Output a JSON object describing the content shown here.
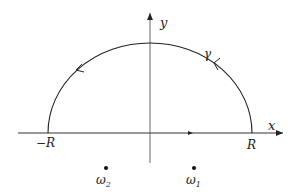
{
  "diagram": {
    "type": "contour-integral",
    "axes": {
      "x_label": "x",
      "y_label": "y"
    },
    "contour": {
      "label": "γ",
      "orientation": "counterclockwise",
      "radius_label": "R"
    },
    "endpoints": {
      "left": "−R",
      "right": "R"
    },
    "points": [
      {
        "id": "omega2",
        "label": "ω",
        "subscript": "2",
        "position": "lower-left"
      },
      {
        "id": "omega1",
        "label": "ω",
        "subscript": "1",
        "position": "lower-right"
      }
    ],
    "colors": {
      "stroke": "#222222",
      "background": "#ffffff"
    }
  }
}
